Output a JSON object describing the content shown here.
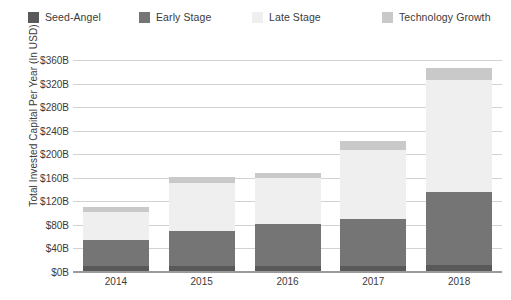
{
  "legend": {
    "position": "top",
    "items": [
      {
        "label": "Seed-Angel",
        "color": "#595959",
        "x": 28
      },
      {
        "label": "Early Stage",
        "color": "#757575",
        "x": 139
      },
      {
        "label": "Late Stage",
        "color": "#efefef",
        "x": 252
      },
      {
        "label": "Technology Growth",
        "color": "#c9c9c9",
        "x": 382
      }
    ]
  },
  "chart_data": {
    "type": "bar",
    "stacked": true,
    "title": "",
    "subtitle": "",
    "xlabel": "",
    "ylabel": "Total Invested Capital Per Year (In USD)",
    "categories": [
      "2014",
      "2015",
      "2016",
      "2017",
      "2018"
    ],
    "ylim": [
      0,
      360
    ],
    "ytick_values": [
      0,
      40,
      80,
      120,
      160,
      200,
      240,
      280,
      320,
      360
    ],
    "ytick_labels": [
      "$0B",
      "$40B",
      "$80B",
      "$120B",
      "$160B",
      "$200B",
      "$240B",
      "$280B",
      "$320B",
      "$360B"
    ],
    "unit": "B",
    "currency": "USD",
    "grid": true,
    "legend_position": "top",
    "series": [
      {
        "name": "Seed-Angel",
        "color": "#595959",
        "values": [
          10,
          11,
          11,
          11,
          12
        ]
      },
      {
        "name": "Early Stage",
        "color": "#757575",
        "values": [
          44,
          58,
          70,
          79,
          124
        ]
      },
      {
        "name": "Late Stage",
        "color": "#efefef",
        "values": [
          48,
          83,
          79,
          118,
          190
        ]
      },
      {
        "name": "Technology Growth",
        "color": "#c9c9c9",
        "values": [
          8,
          10,
          8,
          15,
          20
        ]
      }
    ],
    "totals": [
      110,
      162,
      168,
      223,
      346
    ]
  },
  "style": {
    "background": "#ffffff",
    "grid_color": "#d2d2d2",
    "axis_color": "#9a9a9a",
    "text_color": "#3b3b3b"
  }
}
